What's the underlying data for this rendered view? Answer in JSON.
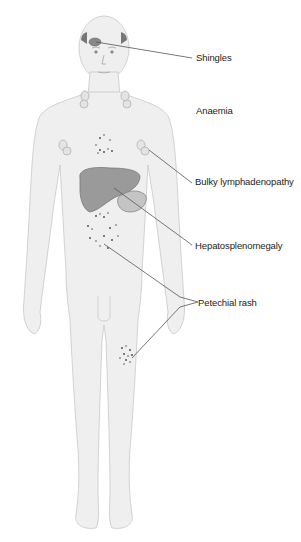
{
  "diagram": {
    "colors": {
      "body_fill": "#efefef",
      "body_outline": "#c8c8c8",
      "organ_fill": "#9a9a9a",
      "spleen_fill": "#c4c4c4",
      "leader_line": "#555555",
      "lesion": "#555555"
    },
    "labels": [
      {
        "id": "shingles",
        "text": "Shingles"
      },
      {
        "id": "anaemia",
        "text": "Anaemia"
      },
      {
        "id": "lymphadenopathy",
        "text": "Bulky lymphadenopathy"
      },
      {
        "id": "hepatosplenomegaly",
        "text": "Hepatosplenomegaly"
      },
      {
        "id": "petechial",
        "text": "Petechial rash"
      }
    ]
  }
}
